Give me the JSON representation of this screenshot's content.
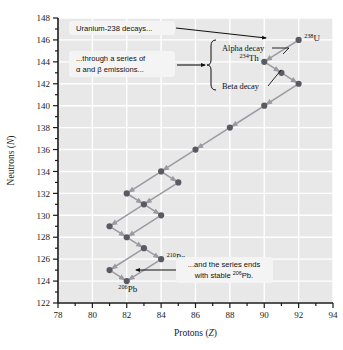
{
  "chart_data": {
    "type": "scatter",
    "title": "",
    "xlabel": "Protons (Z)",
    "ylabel": "Neutrons (N)",
    "xlim": [
      78,
      94
    ],
    "ylim": [
      122,
      148
    ],
    "xticks": [
      78,
      80,
      82,
      84,
      86,
      88,
      90,
      92,
      94
    ],
    "yticks": [
      122,
      124,
      126,
      128,
      130,
      132,
      134,
      136,
      138,
      140,
      142,
      144,
      146,
      148
    ],
    "xtick_step_minor": 1,
    "ytick_step_minor": 1,
    "grid": true,
    "legend": "none",
    "series_name": "Uranium-238 decay series",
    "points": [
      {
        "z": 92,
        "n": 146,
        "label": "238U"
      },
      {
        "z": 90,
        "n": 144,
        "label": "234Th"
      },
      {
        "z": 91,
        "n": 143,
        "label": ""
      },
      {
        "z": 92,
        "n": 142,
        "label": ""
      },
      {
        "z": 90,
        "n": 140,
        "label": ""
      },
      {
        "z": 88,
        "n": 138,
        "label": ""
      },
      {
        "z": 86,
        "n": 136,
        "label": ""
      },
      {
        "z": 84,
        "n": 134,
        "label": ""
      },
      {
        "z": 85,
        "n": 133,
        "label": ""
      },
      {
        "z": 83,
        "n": 131,
        "label": ""
      },
      {
        "z": 84,
        "n": 130,
        "label": ""
      },
      {
        "z": 82,
        "n": 132,
        "label": ""
      },
      {
        "z": 81,
        "n": 129,
        "label": ""
      },
      {
        "z": 82,
        "n": 128,
        "label": ""
      },
      {
        "z": 83,
        "n": 127,
        "label": ""
      },
      {
        "z": 84,
        "n": 126,
        "label": "210Po"
      },
      {
        "z": 81,
        "n": 125,
        "label": ""
      },
      {
        "z": 82,
        "n": 124,
        "label": "206Pb"
      }
    ],
    "decays": [
      {
        "from": [
          92,
          146
        ],
        "to": [
          90,
          144
        ],
        "type": "alpha"
      },
      {
        "from": [
          90,
          144
        ],
        "to": [
          91,
          143
        ],
        "type": "beta"
      },
      {
        "from": [
          91,
          143
        ],
        "to": [
          92,
          142
        ],
        "type": "beta"
      },
      {
        "from": [
          92,
          142
        ],
        "to": [
          90,
          140
        ],
        "type": "alpha"
      },
      {
        "from": [
          90,
          140
        ],
        "to": [
          88,
          138
        ],
        "type": "alpha"
      },
      {
        "from": [
          88,
          138
        ],
        "to": [
          86,
          136
        ],
        "type": "alpha"
      },
      {
        "from": [
          86,
          136
        ],
        "to": [
          84,
          134
        ],
        "type": "alpha"
      },
      {
        "from": [
          84,
          134
        ],
        "to": [
          85,
          133
        ],
        "type": "beta"
      },
      {
        "from": [
          85,
          133
        ],
        "to": [
          83,
          131
        ],
        "type": "alpha"
      },
      {
        "from": [
          83,
          131
        ],
        "to": [
          84,
          130
        ],
        "type": "beta"
      },
      {
        "from": [
          84,
          134
        ],
        "to": [
          82,
          132
        ],
        "type": "alpha"
      },
      {
        "from": [
          82,
          132
        ],
        "to": [
          83,
          131
        ],
        "type": "beta"
      },
      {
        "from": [
          84,
          130
        ],
        "to": [
          82,
          128
        ],
        "type": "alpha"
      },
      {
        "from": [
          83,
          131
        ],
        "to": [
          81,
          129
        ],
        "type": "alpha"
      },
      {
        "from": [
          81,
          129
        ],
        "to": [
          82,
          128
        ],
        "type": "beta"
      },
      {
        "from": [
          82,
          128
        ],
        "to": [
          83,
          127
        ],
        "type": "beta"
      },
      {
        "from": [
          83,
          127
        ],
        "to": [
          84,
          126
        ],
        "type": "beta"
      },
      {
        "from": [
          83,
          127
        ],
        "to": [
          81,
          125
        ],
        "type": "alpha"
      },
      {
        "from": [
          81,
          125
        ],
        "to": [
          82,
          124
        ],
        "type": "beta"
      },
      {
        "from": [
          84,
          126
        ],
        "to": [
          82,
          124
        ],
        "type": "alpha"
      }
    ],
    "nuclide_labels": [
      {
        "z": 92,
        "n": 146,
        "mass": "238",
        "symbol": "U",
        "anchor": "right"
      },
      {
        "z": 90,
        "n": 144,
        "mass": "234",
        "symbol": "Th",
        "anchor": "left"
      },
      {
        "z": 84,
        "n": 126,
        "mass": "210",
        "symbol": "Po",
        "anchor": "right"
      },
      {
        "z": 82,
        "n": 124,
        "mass": "206",
        "symbol": "Pb",
        "anchor": "below"
      }
    ],
    "annotations": [
      {
        "name": "alpha-decay-label",
        "text": "Alpha decay"
      },
      {
        "name": "beta-decay-label",
        "text": "Beta decay"
      }
    ]
  },
  "callouts": {
    "top": {
      "line1": "Uranium-238 decays..."
    },
    "middle": {
      "line1": "...through a series of",
      "line2_pre": "α and β emissions..."
    },
    "bottom": {
      "line1": "...and the series ends",
      "line2_pre": "with stable ",
      "line2_sup": "206",
      "line2_post": "Pb."
    }
  },
  "axes": {
    "x_title": "Protons (Z)",
    "x_title_italic": "Z",
    "y_title": "Neutrons (N)",
    "y_title_italic": "N"
  },
  "colors": {
    "plot_bg": "#e8e8e8",
    "gridline": "#ffffff",
    "axis": "#1a1a1a",
    "marker": "#5a5a62",
    "arrow": "#9a9aa2",
    "callout_bg": "#f4f4f4",
    "text": "#111111"
  }
}
